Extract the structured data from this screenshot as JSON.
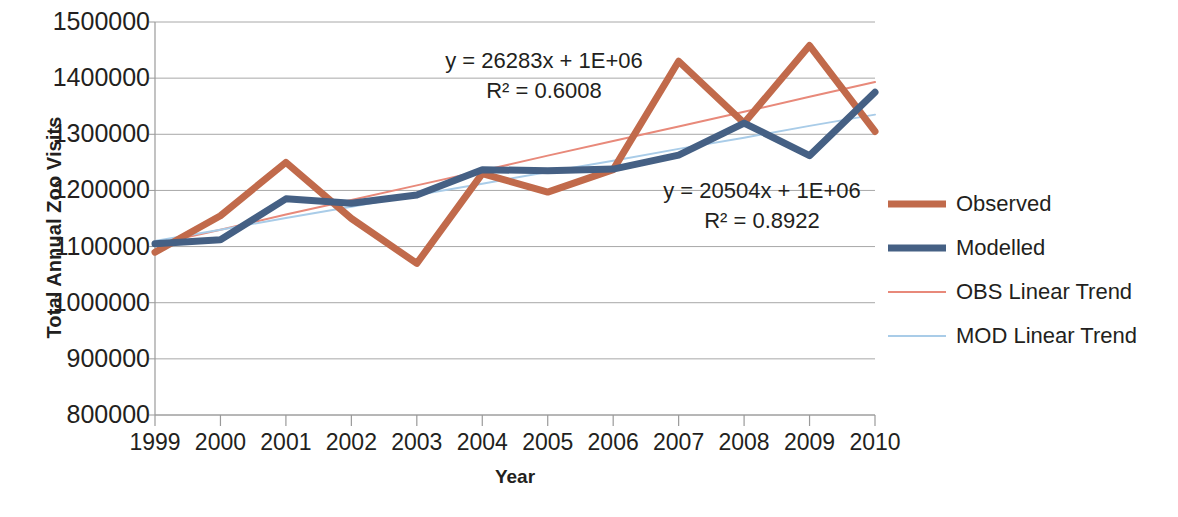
{
  "chart_data": {
    "type": "line",
    "title": "",
    "xlabel": "Year",
    "ylabel": "Total Annual Zoo Visits",
    "categories": [
      "1999",
      "2000",
      "2001",
      "2002",
      "2003",
      "2004",
      "2005",
      "2006",
      "2007",
      "2008",
      "2009",
      "2010"
    ],
    "x_tick_labels": [
      "1999",
      "2000",
      "2001",
      "2002",
      "2003",
      "2004",
      "2005",
      "2006",
      "2007",
      "2008",
      "2009",
      "2010"
    ],
    "y_tick_labels": [
      "1500000",
      "1400000",
      "1300000",
      "1200000",
      "1100000",
      "1000000",
      "900000",
      "800000"
    ],
    "y_tick_values": [
      1500000,
      1400000,
      1300000,
      1200000,
      1100000,
      1000000,
      900000,
      800000
    ],
    "ylim": [
      800000,
      1500000
    ],
    "grid": "horizontal",
    "legend_position": "right",
    "series": [
      {
        "name": "Observed",
        "color": "#C16A4B",
        "width": 7,
        "values": [
          1090000,
          1155000,
          1250000,
          1150000,
          1070000,
          1230000,
          1197000,
          1237000,
          1430000,
          1320000,
          1458000,
          1305000
        ]
      },
      {
        "name": "Modelled",
        "color": "#456084",
        "width": 7,
        "values": [
          1105000,
          1112000,
          1185000,
          1177000,
          1192000,
          1237000,
          1235000,
          1238000,
          1263000,
          1320000,
          1262000,
          1375000
        ]
      },
      {
        "name": "OBS Linear Trend",
        "color": "#E8897A",
        "width": 2,
        "values": [
          1104000,
          1130000,
          1157000,
          1183000,
          1209000,
          1235000,
          1262000,
          1288000,
          1314000,
          1340000,
          1367000,
          1393000
        ]
      },
      {
        "name": "MOD Linear Trend",
        "color": "#A9CCE8",
        "width": 2,
        "values": [
          1110000,
          1130000,
          1151000,
          1171000,
          1192000,
          1212000,
          1233000,
          1253000,
          1274000,
          1294000,
          1315000,
          1335000
        ]
      }
    ],
    "annotations": [
      {
        "id": "obs-trend-equation",
        "equation": "y = 26283x + 1E+06",
        "r_squared": "R² = 0.6008",
        "series": "OBS Linear Trend"
      },
      {
        "id": "mod-trend-equation",
        "equation": "y = 20504x + 1E+06",
        "r_squared": "R² = 0.8922",
        "series": "Modelled"
      }
    ]
  },
  "legend": {
    "items": [
      {
        "label": "Observed",
        "color": "#C16A4B",
        "thickness": 7
      },
      {
        "label": "Modelled",
        "color": "#456084",
        "thickness": 7
      },
      {
        "label": "OBS Linear Trend",
        "color": "#E8897A",
        "thickness": 2
      },
      {
        "label": "MOD Linear Trend",
        "color": "#A9CCE8",
        "thickness": 2
      }
    ]
  },
  "axes": {
    "y_title": "Total Annual Zoo Visits",
    "x_title": "Year"
  },
  "colors": {
    "observed": "#C16A4B",
    "modelled": "#456084",
    "obs_trend": "#E8897A",
    "mod_trend": "#A9CCE8",
    "grid": "#a8a8a8",
    "axis": "#9a9a9a",
    "text": "#231f20"
  }
}
